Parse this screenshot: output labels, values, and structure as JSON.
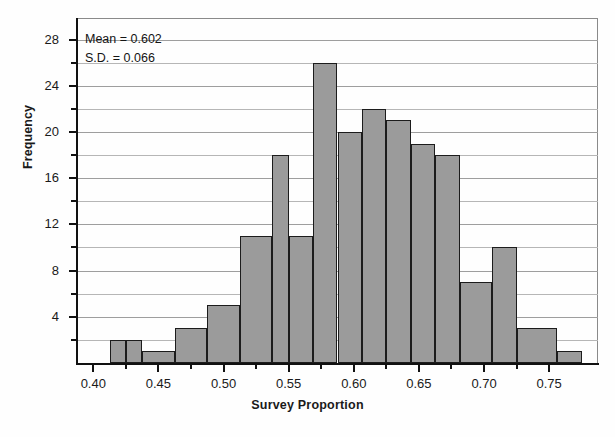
{
  "chart_data": {
    "type": "bar",
    "title": "",
    "xlabel": "Survey Proportion",
    "ylabel": "Frequency",
    "xlim": [
      0.3875,
      0.7875
    ],
    "ylim": [
      0,
      29
    ],
    "grid": true,
    "legend": null,
    "bin_width": 0.0125,
    "categories": [
      "0.4125",
      "0.4250",
      "0.4375",
      "0.4500",
      "0.4625",
      "0.4750",
      "0.4875",
      "0.5000",
      "0.5125",
      "0.5250",
      "0.5375",
      "0.5500",
      "0.5625",
      "0.5750",
      "0.5875",
      "0.6000",
      "0.6125",
      "0.6250"
    ],
    "bins": [
      {
        "left": 0.4125,
        "right": 0.425,
        "value": 2
      },
      {
        "left": 0.425,
        "right": 0.4375,
        "value": 2
      },
      {
        "left": 0.4375,
        "right": 0.4625,
        "value": 1
      },
      {
        "left": 0.4625,
        "right": 0.4875,
        "value": 3
      },
      {
        "left": 0.4875,
        "right": 0.5125,
        "value": 5
      },
      {
        "left": 0.5125,
        "right": 0.5375,
        "value": 11
      },
      {
        "left": 0.5375,
        "right": 0.55,
        "value": 18
      },
      {
        "left": 0.55,
        "right": 0.5688,
        "value": 11
      },
      {
        "left": 0.5688,
        "right": 0.5875,
        "value": 26
      },
      {
        "left": 0.5875,
        "right": 0.6063,
        "value": 20
      },
      {
        "left": 0.6063,
        "right": 0.625,
        "value": 22
      },
      {
        "left": 0.625,
        "right": 0.6438,
        "value": 21
      },
      {
        "left": 0.6438,
        "right": 0.6625,
        "value": 19
      },
      {
        "left": 0.6625,
        "right": 0.6813,
        "value": 18
      },
      {
        "left": 0.6813,
        "right": 0.7063,
        "value": 7
      },
      {
        "left": 0.7063,
        "right": 0.725,
        "value": 10
      },
      {
        "left": 0.725,
        "right": 0.7563,
        "value": 3
      },
      {
        "left": 0.7563,
        "right": 0.775,
        "value": 1
      }
    ],
    "values": [
      2,
      2,
      1,
      3,
      5,
      11,
      18,
      11,
      26,
      20,
      22,
      21,
      19,
      18,
      7,
      10,
      3,
      1
    ],
    "y_ticks_major": [
      4,
      8,
      12,
      16,
      20,
      24,
      28
    ],
    "y_ticks_minor": [
      2,
      6,
      10,
      14,
      18,
      22,
      26
    ],
    "y_tick_labels": [
      "4",
      "8",
      "12",
      "16",
      "20",
      "24",
      "28"
    ],
    "x_ticks_major": [
      0.4,
      0.45,
      0.5,
      0.55,
      0.6,
      0.65,
      0.7,
      0.75
    ],
    "x_tick_labels": [
      "0.40",
      "0.45",
      "0.50",
      "0.55",
      "0.60",
      "0.65",
      "0.70",
      "0.75"
    ],
    "x_ticks_minor": [
      0.425,
      0.475,
      0.525,
      0.575,
      0.625,
      0.675,
      0.725
    ],
    "annotations": {
      "mean_label": "Mean = 0.602",
      "sd_label": "S.D. = 0.066",
      "mean_value": 0.602,
      "sd_value": 0.066
    },
    "colors": {
      "bar_fill": "#9b9b9b",
      "bar_edge": "#1c1c1c",
      "grid": "#b6b6b6",
      "axis": "#111111",
      "text": "#1a1a1a",
      "background": "#ffffff"
    }
  }
}
